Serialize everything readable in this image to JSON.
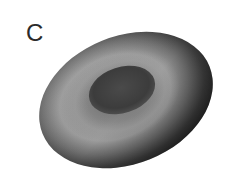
{
  "panel": {
    "label": "C"
  },
  "figure": {
    "colors": {
      "background": "#ffffff",
      "rim_highlight": "#9a9a9a",
      "outer_shadow": "#2c2c2c",
      "inner_dimple": "#3a3a3a",
      "label": "#2a2a2a"
    }
  }
}
